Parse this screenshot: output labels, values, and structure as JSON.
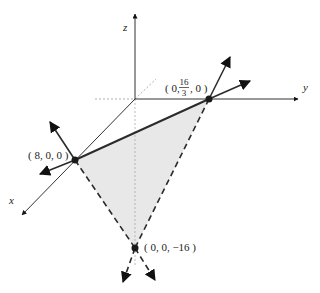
{
  "diagram": {
    "type": "3d-coordinate-plane-intercepts",
    "axes": {
      "x_label": "x",
      "y_label": "y",
      "z_label": "z"
    },
    "points": [
      {
        "id": "x-intercept",
        "label": "( 8, 0, 0 )"
      },
      {
        "id": "y-intercept",
        "label_prefix": "( 0, ",
        "label_num": "16",
        "label_den": "3",
        "label_suffix": ", 0 )"
      },
      {
        "id": "z-intercept",
        "label": "( 0, 0, −16 )"
      }
    ],
    "colors": {
      "fill": "#e6e6e6",
      "line": "#2b2b2b",
      "axis": "#333333",
      "dotted": "#aaaaaa"
    }
  }
}
